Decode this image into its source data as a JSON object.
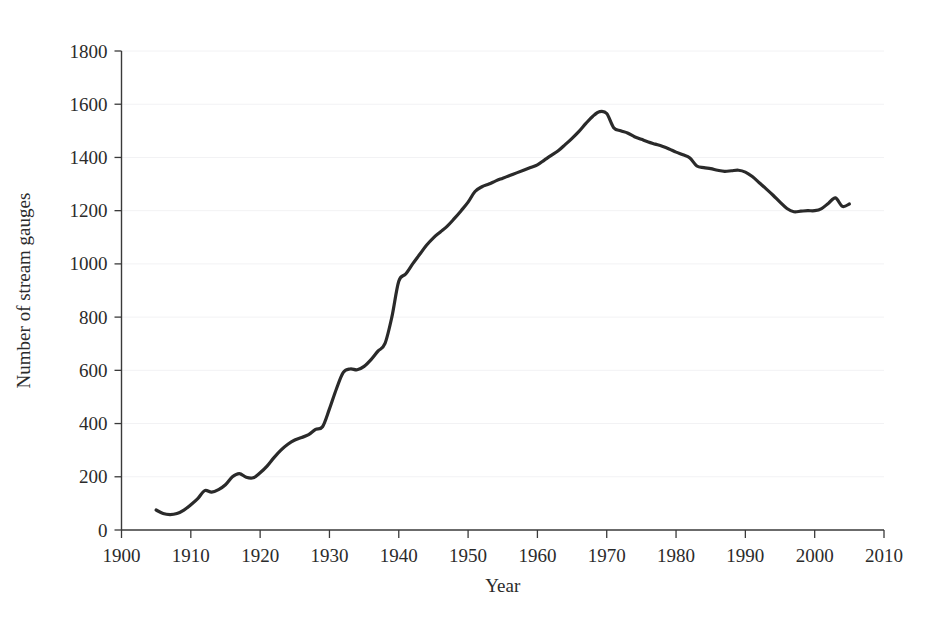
{
  "figure": {
    "background_color": "#ffffff",
    "title_fragment": ""
  },
  "chart_data": {
    "type": "line",
    "title": "",
    "xlabel": "Year",
    "ylabel": "Number of stream gauges",
    "xlim": [
      1900,
      2010
    ],
    "ylim": [
      0,
      1800
    ],
    "xticks": [
      1900,
      1910,
      1920,
      1930,
      1940,
      1950,
      1960,
      1970,
      1980,
      1990,
      2000,
      2010
    ],
    "yticks": [
      0,
      200,
      400,
      600,
      800,
      1000,
      1200,
      1400,
      1600,
      1800
    ],
    "grid": "faint-horizontal",
    "legend": null,
    "line_color": "#2a2a2a",
    "series": [
      {
        "name": "Number of stream gauges",
        "x": [
          1905,
          1906,
          1907,
          1908,
          1909,
          1910,
          1911,
          1912,
          1913,
          1914,
          1915,
          1916,
          1917,
          1918,
          1919,
          1920,
          1921,
          1922,
          1923,
          1924,
          1925,
          1926,
          1927,
          1928,
          1929,
          1930,
          1931,
          1932,
          1933,
          1934,
          1935,
          1936,
          1937,
          1938,
          1939,
          1940,
          1941,
          1942,
          1943,
          1944,
          1945,
          1946,
          1947,
          1948,
          1949,
          1950,
          1951,
          1952,
          1953,
          1954,
          1955,
          1956,
          1957,
          1958,
          1959,
          1960,
          1961,
          1962,
          1963,
          1964,
          1965,
          1966,
          1967,
          1968,
          1969,
          1970,
          1971,
          1972,
          1973,
          1974,
          1975,
          1976,
          1977,
          1978,
          1979,
          1980,
          1981,
          1982,
          1983,
          1984,
          1985,
          1986,
          1987,
          1988,
          1989,
          1990,
          1991,
          1992,
          1993,
          1994,
          1995,
          1996,
          1997,
          1998,
          1999,
          2000,
          2001,
          2002,
          2003,
          2004,
          2005
        ],
        "values": [
          75,
          62,
          58,
          62,
          75,
          95,
          118,
          148,
          142,
          152,
          170,
          200,
          212,
          198,
          196,
          215,
          240,
          272,
          300,
          322,
          338,
          348,
          358,
          378,
          388,
          455,
          530,
          592,
          605,
          602,
          615,
          640,
          672,
          700,
          800,
          935,
          962,
          1000,
          1035,
          1070,
          1098,
          1120,
          1142,
          1170,
          1200,
          1232,
          1272,
          1290,
          1300,
          1312,
          1322,
          1332,
          1342,
          1352,
          1362,
          1372,
          1390,
          1408,
          1425,
          1448,
          1472,
          1498,
          1528,
          1555,
          1572,
          1565,
          1512,
          1500,
          1492,
          1478,
          1468,
          1458,
          1450,
          1442,
          1432,
          1420,
          1410,
          1398,
          1368,
          1362,
          1358,
          1352,
          1348,
          1350,
          1352,
          1345,
          1328,
          1305,
          1282,
          1258,
          1232,
          1208,
          1196,
          1198,
          1200,
          1200,
          1208,
          1228,
          1248,
          1216,
          1225
        ]
      }
    ]
  },
  "axis": {
    "x_title": "Year",
    "y_title": "Number of stream gauges",
    "x_tick_labels": [
      "1900",
      "1910",
      "1920",
      "1930",
      "1940",
      "1950",
      "1960",
      "1970",
      "1980",
      "1990",
      "2000",
      "2010"
    ],
    "y_tick_labels": [
      "0",
      "200",
      "400",
      "600",
      "800",
      "1000",
      "1200",
      "1400",
      "1600",
      "1800"
    ]
  }
}
